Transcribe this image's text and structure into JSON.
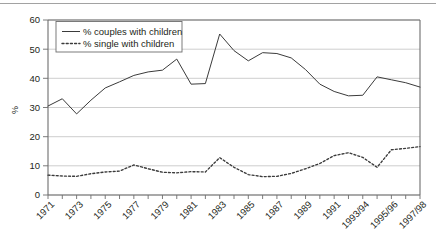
{
  "chart_data": {
    "type": "line",
    "title": "",
    "subtitle": "",
    "xlabel": "",
    "ylabel": "%",
    "ylim": [
      0,
      60
    ],
    "yticks": [
      0,
      10,
      20,
      30,
      40,
      50,
      60
    ],
    "ytick_labels": [
      "0",
      "10",
      "20",
      "30",
      "40",
      "50",
      "60"
    ],
    "grid": "horizontal",
    "legend_position": "top-left-inside",
    "categories": [
      "1971",
      "1972",
      "1973",
      "1974",
      "1975",
      "1976",
      "1977",
      "1978",
      "1979",
      "1980",
      "1981",
      "1982",
      "1983",
      "1984",
      "1985",
      "1986",
      "1987",
      "1988",
      "1989",
      "1990",
      "1991",
      "1992",
      "1993/94",
      "1994/95",
      "1995/96",
      "1996/97",
      "1997/98"
    ],
    "xtick_labels": [
      "1971",
      "1973",
      "1975",
      "1977",
      "1979",
      "1981",
      "1983",
      "1985",
      "1987",
      "1989",
      "1991",
      "1993/94",
      "1995/96",
      "1997/98"
    ],
    "series": [
      {
        "name": "% couples with children",
        "style": "solid",
        "color": "#3b3b3b",
        "values": [
          30.5,
          33.0,
          27.8,
          32.5,
          36.7,
          38.8,
          41.0,
          42.2,
          42.8,
          46.6,
          38.0,
          38.2,
          55.2,
          49.5,
          46.0,
          48.8,
          48.5,
          47.0,
          43.0,
          38.0,
          35.5,
          34.0,
          34.2,
          40.5,
          39.5,
          38.5,
          37.0
        ]
      },
      {
        "name": "% single with children",
        "style": "dotted",
        "color": "#3b3b3b",
        "values": [
          6.8,
          6.5,
          6.4,
          7.3,
          7.9,
          8.2,
          10.3,
          9.0,
          7.8,
          7.6,
          8.0,
          7.9,
          12.8,
          9.5,
          7.0,
          6.3,
          6.4,
          7.4,
          9.0,
          10.8,
          13.5,
          14.5,
          12.9,
          9.5,
          15.5,
          16.0,
          16.6
        ]
      }
    ],
    "legend": [
      "% couples with children",
      "% single with children"
    ]
  }
}
